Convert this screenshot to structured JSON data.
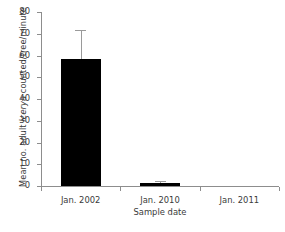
{
  "chart_data": {
    "type": "bar",
    "title": "",
    "categories": [
      "Jan. 2002",
      "Jan. 2010",
      "Jan. 2011"
    ],
    "values": [
      58.6,
      1.2,
      0
    ],
    "errors_upper": [
      13.3,
      1.1,
      0
    ],
    "xlabel": "Sample date",
    "ylabel_parts": {
      "before": "Mean no. adult ",
      "species": "Icerya",
      "after": " counted/tree/minute"
    },
    "ylabel": "Mean no. adult Icerya counted/tree/minute",
    "ylim": [
      0,
      80
    ],
    "yticks": [
      0,
      10,
      20,
      30,
      40,
      50,
      60,
      70,
      80
    ],
    "ytick_labels": [
      "0",
      "10",
      "20",
      "30",
      "40",
      "50",
      "60",
      "70",
      "80"
    ],
    "grid": false,
    "legend": null,
    "bar_color": "#000000",
    "error_color": "#9a9a9a",
    "axis_color": "#8d8d8d",
    "text_color": "#3a3a3a"
  }
}
